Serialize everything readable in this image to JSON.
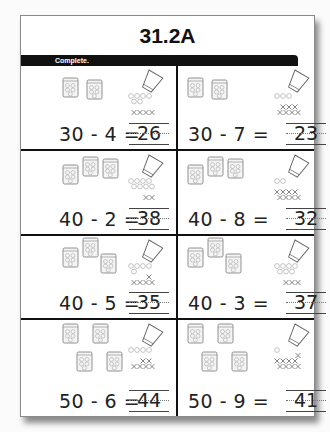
{
  "worksheet": {
    "title": "31.2A",
    "instruction": "Complete.",
    "problems": [
      {
        "minuend": 30,
        "subtrahend": 4,
        "expression": "30 - 4 =",
        "answer": "26",
        "bags": 2,
        "crossed": 4
      },
      {
        "minuend": 30,
        "subtrahend": 7,
        "expression": "30 - 7 =",
        "answer": "23",
        "bags": 2,
        "crossed": 7
      },
      {
        "minuend": 40,
        "subtrahend": 2,
        "expression": "40 - 2 =",
        "answer": "38",
        "bags": 3,
        "crossed": 2
      },
      {
        "minuend": 40,
        "subtrahend": 8,
        "expression": "40 - 8 =",
        "answer": "32",
        "bags": 3,
        "crossed": 8
      },
      {
        "minuend": 40,
        "subtrahend": 5,
        "expression": "40 - 5 =",
        "answer": "35",
        "bags": 3,
        "crossed": 5
      },
      {
        "minuend": 40,
        "subtrahend": 3,
        "expression": "40 - 3 =",
        "answer": "37",
        "bags": 3,
        "crossed": 3
      },
      {
        "minuend": 50,
        "subtrahend": 6,
        "expression": "50 - 6 =",
        "answer": "44",
        "bags": 4,
        "crossed": 6
      },
      {
        "minuend": 50,
        "subtrahend": 9,
        "expression": "50 - 9 =",
        "answer": "41",
        "bags": 4,
        "crossed": 9
      }
    ],
    "icons": {
      "bag": "bag-of-ten-icon",
      "cup": "spilled-cup-icon",
      "bead": "loose-bead-icon",
      "cross": "crossed-out-mark-icon"
    }
  }
}
